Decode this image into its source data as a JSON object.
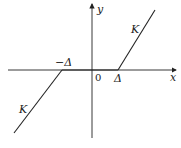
{
  "diagram": {
    "type": "dead-zone-nonlinearity",
    "axes": {
      "x_label": "x",
      "y_label": "y",
      "origin_label": "0"
    },
    "breakpoints": {
      "negative_label": "−Δ",
      "positive_label": "Δ"
    },
    "slopes": {
      "upper_label": "K",
      "lower_label": "K"
    },
    "colors": {
      "stroke": "#222222",
      "background": "#ffffff"
    }
  }
}
